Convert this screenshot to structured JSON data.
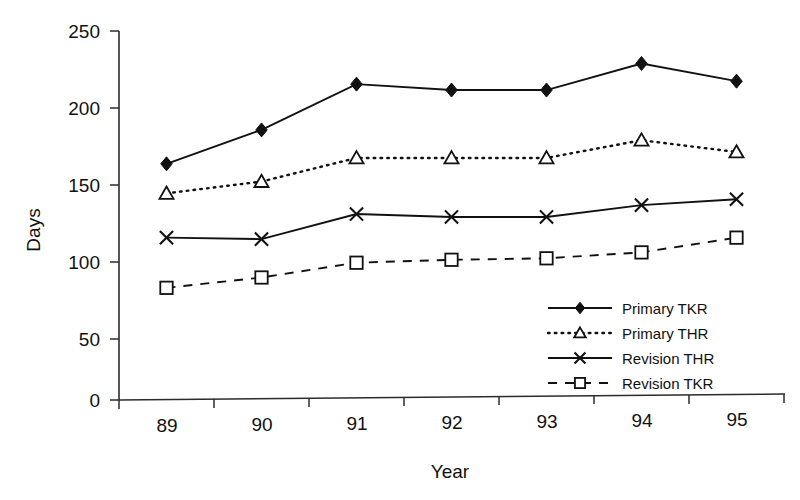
{
  "chart_data": {
    "type": "line",
    "title": "",
    "xlabel": "Year",
    "ylabel": "Days",
    "categories": [
      "89",
      "90",
      "91",
      "92",
      "93",
      "94",
      "95"
    ],
    "xtick_labels": [
      "89",
      "90",
      "91",
      "92",
      "93",
      "94",
      "95"
    ],
    "ytick_labels": [
      "0",
      "50",
      "100",
      "150",
      "200",
      "250"
    ],
    "yticks": [
      0,
      50,
      100,
      150,
      200,
      250
    ],
    "ylim": [
      0,
      250
    ],
    "grid": false,
    "legend_position": "lower-right",
    "series": [
      {
        "name": "Primary TKR",
        "marker": "filled-diamond",
        "line_style": "solid",
        "color": "#111111",
        "values": [
          160,
          183,
          214,
          210,
          210,
          228,
          216
        ]
      },
      {
        "name": "Primary THR",
        "marker": "open-triangle",
        "line_style": "dotted",
        "color": "#111111",
        "values": [
          140,
          148,
          164,
          164,
          164,
          176,
          168
        ]
      },
      {
        "name": "Revision THR",
        "marker": "cross",
        "line_style": "solid",
        "color": "#111111",
        "values": [
          110,
          109,
          126,
          124,
          124,
          132,
          136
        ]
      },
      {
        "name": "Revision TKR",
        "marker": "open-square",
        "line_style": "dashed",
        "color": "#111111",
        "values": [
          76,
          83,
          93,
          95,
          96,
          100,
          110
        ]
      }
    ]
  },
  "legend": {
    "entries": [
      {
        "label": "Primary TKR",
        "marker": "filled-diamond",
        "line_style": "solid"
      },
      {
        "label": "Primary THR",
        "marker": "open-triangle",
        "line_style": "dotted"
      },
      {
        "label": "Revision THR",
        "marker": "cross",
        "line_style": "solid"
      },
      {
        "label": "Revision TKR",
        "marker": "open-square",
        "line_style": "dashed"
      }
    ]
  }
}
